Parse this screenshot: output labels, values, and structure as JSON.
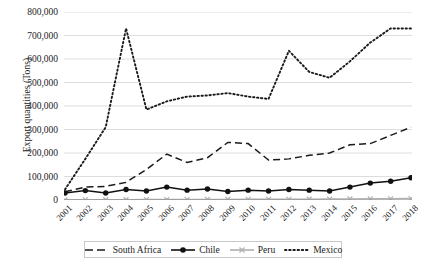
{
  "chart_data": {
    "type": "line",
    "title": "",
    "xlabel": "",
    "ylabel": "Export quantities (Tons)",
    "ylim": [
      0,
      800000
    ],
    "yticks": [
      "0",
      "100,000",
      "200,000",
      "300,000",
      "400,000",
      "500,000",
      "600,000",
      "700,000",
      "800,000"
    ],
    "ytick_values": [
      0,
      100000,
      200000,
      300000,
      400000,
      500000,
      600000,
      700000,
      800000
    ],
    "grid": true,
    "legend_position": "bottom",
    "categories": [
      "2001",
      "2002",
      "2003",
      "2004",
      "2005",
      "2006",
      "2007",
      "2008",
      "2009",
      "2010",
      "2011",
      "2012",
      "2013",
      "2014",
      "2015",
      "2016",
      "2017",
      "2018"
    ],
    "x": [
      2001,
      2002,
      2003,
      2004,
      2005,
      2006,
      2007,
      2008,
      2009,
      2010,
      2011,
      2012,
      2013,
      2014,
      2015,
      2016,
      2017,
      2018
    ],
    "series": [
      {
        "name": "South Africa",
        "style": "dashed",
        "color": "#1a1a1a",
        "marker": "none",
        "values": [
          35000,
          55000,
          58000,
          75000,
          130000,
          195000,
          160000,
          180000,
          245000,
          240000,
          170000,
          175000,
          190000,
          200000,
          235000,
          240000,
          275000,
          310000
        ]
      },
      {
        "name": "Chile",
        "style": "solid",
        "color": "#111111",
        "marker": "circle",
        "values": [
          30000,
          40000,
          30000,
          45000,
          38000,
          55000,
          42000,
          47000,
          36000,
          42000,
          38000,
          45000,
          42000,
          38000,
          55000,
          72000,
          80000,
          95000
        ]
      },
      {
        "name": "Peru",
        "style": "solid",
        "color": "#b0b0b0",
        "marker": "x",
        "values": [
          1000,
          1200,
          1500,
          1500,
          1800,
          2000,
          2200,
          2500,
          2500,
          2800,
          3000,
          3200,
          3500,
          4000,
          4500,
          5000,
          5500,
          6000
        ]
      },
      {
        "name": "Mexico",
        "style": "dotted",
        "color": "#1a1a1a",
        "marker": "none",
        "values": [
          45000,
          175000,
          310000,
          730000,
          385000,
          420000,
          440000,
          445000,
          455000,
          440000,
          430000,
          635000,
          545000,
          520000,
          590000,
          670000,
          730000,
          730000
        ]
      }
    ]
  },
  "legend": {
    "items": [
      {
        "label": "South Africa",
        "icon": "dashed-line-icon"
      },
      {
        "label": "Chile",
        "icon": "solid-line-circle-icon"
      },
      {
        "label": "Peru",
        "icon": "gray-line-x-icon"
      },
      {
        "label": "Mexico",
        "icon": "dotted-line-icon"
      }
    ]
  }
}
